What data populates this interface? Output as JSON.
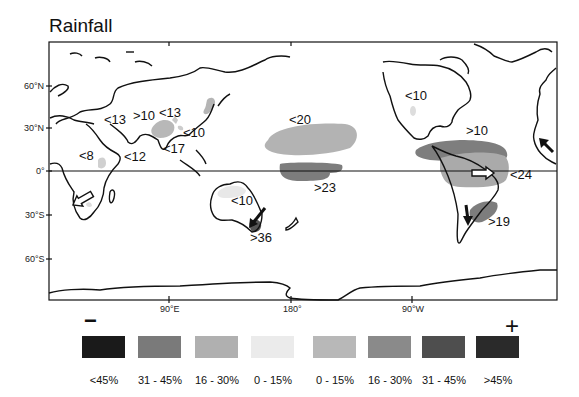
{
  "title": "Rainfall",
  "axes": {
    "lat_labels": [
      {
        "label": "60°N",
        "y": 86
      },
      {
        "label": "30°N",
        "y": 128
      },
      {
        "label": "0°",
        "y": 171
      },
      {
        "label": "30°S",
        "y": 215
      },
      {
        "label": "60°S",
        "y": 259
      }
    ],
    "lon_labels": [
      {
        "label": "90°E",
        "x": 169
      },
      {
        "label": "180°",
        "x": 291
      },
      {
        "label": "90°W",
        "x": 412
      }
    ]
  },
  "annotations": [
    {
      "text": "<13",
      "x": 104,
      "y": 114
    },
    {
      "text": ">10",
      "x": 133,
      "y": 110
    },
    {
      "text": "<13",
      "x": 159,
      "y": 107
    },
    {
      "text": "<10",
      "x": 183,
      "y": 127
    },
    {
      "text": "<17",
      "x": 163,
      "y": 143
    },
    {
      "text": "<8",
      "x": 79,
      "y": 150
    },
    {
      "text": "<12",
      "x": 124,
      "y": 151
    },
    {
      "text": "<20",
      "x": 289,
      "y": 114
    },
    {
      "text": ">23",
      "x": 314,
      "y": 182
    },
    {
      "text": "<10",
      "x": 231,
      "y": 195
    },
    {
      "text": ">36",
      "x": 250,
      "y": 232
    },
    {
      "text": "<10",
      "x": 405,
      "y": 90
    },
    {
      "text": ">10",
      "x": 466,
      "y": 125
    },
    {
      "text": "<24",
      "x": 510,
      "y": 169
    },
    {
      "text": ">19",
      "x": 488,
      "y": 216
    }
  ],
  "legend": {
    "minus_symbol": "−",
    "plus_symbol": "+",
    "items": [
      {
        "label": "<45%",
        "color": "#1a1a1a",
        "sign": "decrease"
      },
      {
        "label": "31 - 45%",
        "color": "#7a7a7a",
        "sign": "decrease"
      },
      {
        "label": "16 - 30%",
        "color": "#b0b0b0",
        "sign": "decrease"
      },
      {
        "label": "0 - 15%",
        "color": "#e8e8e8",
        "sign": "decrease"
      },
      {
        "label": "0 - 15%",
        "color": "#b8b8b8",
        "sign": "increase"
      },
      {
        "label": "16 - 30%",
        "color": "#8a8a8a",
        "sign": "increase"
      },
      {
        "label": "31 - 45%",
        "color": "#4e4e4e",
        "sign": "increase"
      },
      {
        "label": ">45%",
        "color": "#2a2a2a",
        "sign": "increase"
      }
    ]
  }
}
